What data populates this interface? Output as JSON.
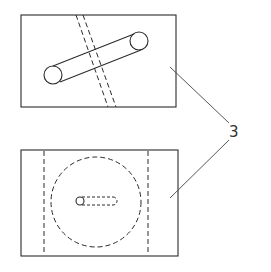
{
  "diagram": {
    "type": "technical-drawing",
    "views": [
      {
        "name": "top-view",
        "description": "Rectangle with diagonal cylinder and dashed diagonal channel"
      },
      {
        "name": "bottom-view",
        "description": "Rectangle with two dashed vertical lines, dashed circle and small dashed slot"
      }
    ],
    "label": {
      "text": "3"
    },
    "colors": {
      "line": "#2a2a2a",
      "background": "#ffffff"
    }
  }
}
